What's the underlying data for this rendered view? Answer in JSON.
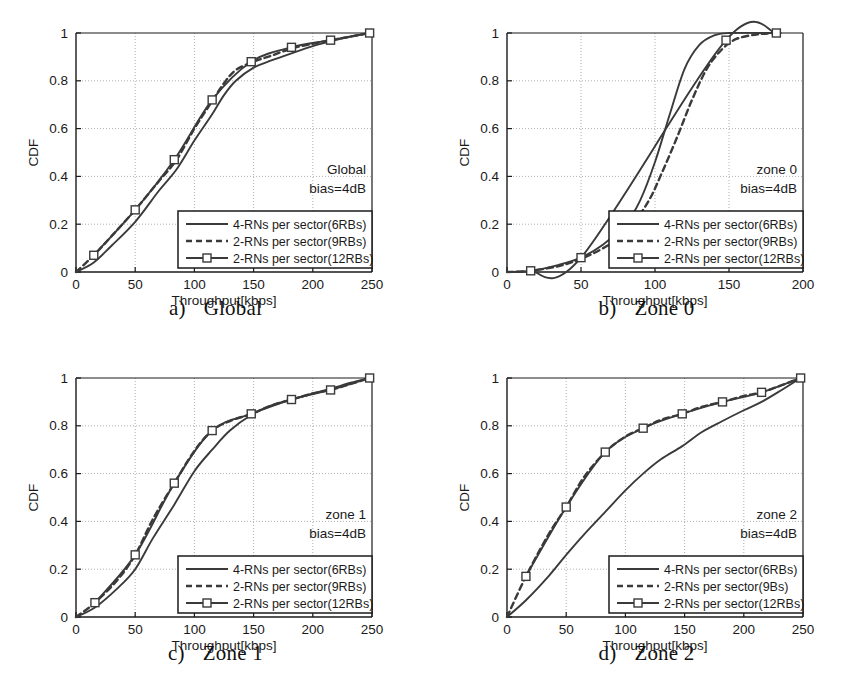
{
  "figure": {
    "background": "#ffffff",
    "curve_color": "#3a3a3a",
    "grid_color": "#9a9a9a",
    "axis_color": "#1a1a1a",
    "marker_fill": "#ffffff"
  },
  "common": {
    "ylabel": "CDF",
    "xlabel": "Throughput[kbps]",
    "yticks": [
      "0",
      "0.2",
      "0.4",
      "0.6",
      "0.8",
      "1"
    ],
    "ytick_values": [
      0,
      0.2,
      0.4,
      0.6,
      0.8,
      1
    ],
    "legend_labels": {
      "series1": "4-RNs per sector(6RBs)",
      "series2": "2-RNs per sector(9RBs)",
      "series3": "2-RNs per sector(12RBs)",
      "series2_alt": "2-RNs per sector(9Bs)"
    },
    "bias_text": "bias=4dB"
  },
  "panels": [
    {
      "id": "a",
      "caption_index": "a)",
      "caption_text": "Global",
      "annotation_title": "Global",
      "annotation_bias": "bias=4dB",
      "xticks": [
        "0",
        "50",
        "100",
        "150",
        "200",
        "250"
      ],
      "legend": [
        "4-RNs per sector(6RBs)",
        "2-RNs per sector(9RBs)",
        "2-RNs per sector(12RBs)"
      ]
    },
    {
      "id": "b",
      "caption_index": "b)",
      "caption_text": "Zone 0",
      "annotation_title": "zone 0",
      "annotation_bias": "bias=4dB",
      "xticks": [
        "0",
        "50",
        "100",
        "150",
        "200"
      ],
      "legend": [
        "4-RNs per sector(6RBs)",
        "2-RNs per sector(9RBs)",
        "2-RNs per sector(12RBs)"
      ]
    },
    {
      "id": "c",
      "caption_index": "c)",
      "caption_text": "Zone 1",
      "annotation_title": "zone 1",
      "annotation_bias": "bias=4dB",
      "xticks": [
        "0",
        "50",
        "100",
        "150",
        "200",
        "250"
      ],
      "legend": [
        "4-RNs per sector(6RBs)",
        "2-RNs per sector(9RBs)",
        "2-RNs per sector(12RBs)"
      ]
    },
    {
      "id": "d",
      "caption_index": "d)",
      "caption_text": "Zone 2",
      "annotation_title": "zone 2",
      "annotation_bias": "bias=4dB",
      "xticks": [
        "0",
        "50",
        "100",
        "150",
        "200",
        "250"
      ],
      "legend": [
        "4-RNs per sector(6RBs)",
        "2-RNs per sector(9Bs)",
        "2-RNs per sector(12RBs)"
      ]
    }
  ],
  "chart_data": [
    {
      "type": "line",
      "title": "a) Global",
      "xlabel": "Throughput[kbps]",
      "ylabel": "CDF",
      "xlim": [
        0,
        250
      ],
      "ylim": [
        0,
        1
      ],
      "xticks": [
        0,
        50,
        100,
        150,
        200,
        250
      ],
      "yticks": [
        0,
        0.2,
        0.4,
        0.6,
        0.8,
        1
      ],
      "grid": true,
      "legend_position": "lower-right",
      "annotations": [
        "Global",
        "bias=4dB"
      ],
      "series": [
        {
          "name": "4-RNs per sector(6RBs)",
          "style": "solid",
          "marker": "none",
          "x": [
            0,
            15,
            30,
            50,
            70,
            85,
            100,
            115,
            125,
            135,
            150,
            165,
            182,
            200,
            215,
            232,
            248
          ],
          "y": [
            0.0,
            0.04,
            0.11,
            0.21,
            0.34,
            0.43,
            0.55,
            0.66,
            0.74,
            0.8,
            0.855,
            0.885,
            0.915,
            0.945,
            0.965,
            0.985,
            1.0
          ]
        },
        {
          "name": "2-RNs per sector(9RBs)",
          "style": "dashed",
          "marker": "none",
          "x": [
            0,
            15,
            30,
            50,
            70,
            85,
            100,
            115,
            125,
            135,
            150,
            165,
            182,
            200,
            215,
            232,
            248
          ],
          "y": [
            0.0,
            0.07,
            0.15,
            0.26,
            0.38,
            0.47,
            0.6,
            0.715,
            0.79,
            0.845,
            0.88,
            0.905,
            0.935,
            0.955,
            0.97,
            0.985,
            1.0
          ]
        },
        {
          "name": "2-RNs per sector(12RBs)",
          "style": "solid",
          "marker": "square",
          "x": [
            15,
            50,
            83,
            115,
            148,
            182,
            215,
            248
          ],
          "y": [
            0.07,
            0.26,
            0.47,
            0.72,
            0.88,
            0.94,
            0.97,
            1.0
          ]
        }
      ]
    },
    {
      "type": "line",
      "title": "b) Zone 0",
      "xlabel": "Throughput[kbps]",
      "ylabel": "CDF",
      "xlim": [
        0,
        200
      ],
      "ylim": [
        0,
        1
      ],
      "xticks": [
        0,
        50,
        100,
        150,
        200
      ],
      "yticks": [
        0,
        0.2,
        0.4,
        0.6,
        0.8,
        1
      ],
      "grid": true,
      "legend_position": "lower-right",
      "annotations": [
        "zone 0",
        "bias=4dB"
      ],
      "series": [
        {
          "name": "4-RNs per sector(6RBs)",
          "style": "solid",
          "marker": "none",
          "x": [
            0,
            16,
            35,
            50,
            65,
            80,
            90,
            100,
            110,
            120,
            130,
            140,
            150,
            170,
            185
          ],
          "y": [
            0.0,
            0.005,
            0.03,
            0.06,
            0.115,
            0.2,
            0.3,
            0.46,
            0.66,
            0.85,
            0.95,
            0.99,
            1.0,
            1.0,
            1.0
          ]
        },
        {
          "name": "2-RNs per sector(9RBs)",
          "style": "dashed",
          "marker": "none",
          "x": [
            0,
            16,
            35,
            50,
            65,
            80,
            95,
            105,
            115,
            125,
            135,
            145,
            155,
            170,
            185
          ],
          "y": [
            0.0,
            0.005,
            0.025,
            0.055,
            0.1,
            0.165,
            0.29,
            0.42,
            0.565,
            0.72,
            0.85,
            0.93,
            0.975,
            0.995,
            1.0
          ]
        },
        {
          "name": "2-RNs per sector(12RBs)",
          "style": "solid",
          "marker": "square",
          "x": [
            16,
            50,
            148,
            182
          ],
          "y": [
            0.005,
            0.06,
            0.97,
            1.0
          ]
        }
      ]
    },
    {
      "type": "line",
      "title": "c) Zone 1",
      "xlabel": "Throughput[kbps]",
      "ylabel": "CDF",
      "xlim": [
        0,
        250
      ],
      "ylim": [
        0,
        1
      ],
      "xticks": [
        0,
        50,
        100,
        150,
        200,
        250
      ],
      "yticks": [
        0,
        0.2,
        0.4,
        0.6,
        0.8,
        1
      ],
      "grid": true,
      "legend_position": "lower-right",
      "annotations": [
        "zone 1",
        "bias=4dB"
      ],
      "series": [
        {
          "name": "4-RNs per sector(6RBs)",
          "style": "solid",
          "marker": "none",
          "x": [
            0,
            16,
            35,
            50,
            65,
            83,
            100,
            115,
            130,
            148,
            165,
            182,
            200,
            215,
            232,
            248
          ],
          "y": [
            0.0,
            0.04,
            0.12,
            0.2,
            0.33,
            0.47,
            0.61,
            0.7,
            0.78,
            0.845,
            0.885,
            0.91,
            0.935,
            0.955,
            0.98,
            1.0
          ]
        },
        {
          "name": "2-RNs per sector(9RBs)",
          "style": "dashed",
          "marker": "none",
          "x": [
            0,
            16,
            35,
            50,
            65,
            83,
            100,
            115,
            130,
            148,
            165,
            182,
            200,
            215,
            232,
            248
          ],
          "y": [
            0.0,
            0.06,
            0.155,
            0.26,
            0.41,
            0.56,
            0.695,
            0.78,
            0.82,
            0.85,
            0.885,
            0.91,
            0.935,
            0.95,
            0.975,
            1.0
          ]
        },
        {
          "name": "2-RNs per sector(12RBs)",
          "style": "solid",
          "marker": "square",
          "x": [
            16,
            50,
            83,
            115,
            148,
            182,
            215,
            248
          ],
          "y": [
            0.06,
            0.26,
            0.56,
            0.78,
            0.85,
            0.91,
            0.95,
            1.0
          ]
        }
      ]
    },
    {
      "type": "line",
      "title": "d) Zone 2",
      "xlabel": "Throughput[kbps]",
      "ylabel": "CDF",
      "xlim": [
        0,
        250
      ],
      "ylim": [
        0,
        1
      ],
      "xticks": [
        0,
        50,
        100,
        150,
        200,
        250
      ],
      "yticks": [
        0,
        0.2,
        0.4,
        0.6,
        0.8,
        1
      ],
      "grid": true,
      "legend_position": "lower-right",
      "annotations": [
        "zone 2",
        "bias=4dB"
      ],
      "series": [
        {
          "name": "4-RNs per sector(6RBs)",
          "style": "solid",
          "marker": "none",
          "x": [
            0,
            16,
            35,
            50,
            65,
            83,
            100,
            115,
            130,
            148,
            165,
            182,
            200,
            215,
            232,
            248
          ],
          "y": [
            0.0,
            0.07,
            0.17,
            0.26,
            0.345,
            0.44,
            0.53,
            0.6,
            0.66,
            0.715,
            0.775,
            0.82,
            0.865,
            0.9,
            0.95,
            1.0
          ]
        },
        {
          "name": "2-RNs per sector(9Bs)",
          "style": "dashed",
          "marker": "none",
          "x": [
            0,
            16,
            35,
            50,
            65,
            83,
            100,
            115,
            130,
            148,
            165,
            182,
            200,
            215,
            232,
            248
          ],
          "y": [
            0.0,
            0.17,
            0.345,
            0.46,
            0.585,
            0.69,
            0.755,
            0.79,
            0.825,
            0.85,
            0.88,
            0.9,
            0.925,
            0.94,
            0.97,
            1.0
          ]
        },
        {
          "name": "2-RNs per sector(12RBs)",
          "style": "solid",
          "marker": "square",
          "x": [
            16,
            50,
            83,
            115,
            148,
            182,
            215,
            248
          ],
          "y": [
            0.17,
            0.46,
            0.69,
            0.79,
            0.85,
            0.9,
            0.94,
            1.0
          ]
        }
      ]
    }
  ]
}
